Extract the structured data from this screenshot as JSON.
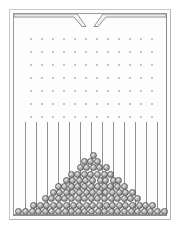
{
  "figure": {
    "subtitle": "bean machine / quincunx",
    "background_color": "#ffffff",
    "frame_outer_color": "#c9c9c9",
    "frame_inner_color": "#8c8c8c",
    "pin_color": "#b9b9bf",
    "divider_color": "#8f8f96",
    "ball_fill_color": "#bdbdbd",
    "ball_outline_color": "#5d5d5d"
  },
  "geometry": {
    "canvas_width": 181,
    "canvas_height": 230,
    "frame_outer": {
      "x": 9,
      "y": 9,
      "width": 162,
      "height": 211
    },
    "frame_inner": {
      "x": 13,
      "y": 13,
      "width": 154,
      "height": 203
    },
    "funnel": {
      "gap_center_x": 90,
      "gap_width": 8,
      "mouth_y": 14,
      "throat_y": 27
    },
    "pin_grid": {
      "rows": 7,
      "columns": 12,
      "first_pin_x": 30,
      "first_pin_y": 38,
      "spacing_x": 11,
      "spacing_y": 13,
      "pin_diameter": 1.6
    },
    "dividers": {
      "count": 13,
      "top_y": 122,
      "bottom_y": 214,
      "first_x": 25,
      "spacing_x": 11
    },
    "ball": {
      "diameter": 7,
      "row_pitch": 6.2,
      "column_pitch": 6.4
    },
    "floor_y": 214
  },
  "chart_data": {
    "type": "bar",
    "subtitle": "Number of balls collected per bin",
    "xlabel": "Bin",
    "ylabel": "Ball count (stack height)",
    "categories": [
      "1",
      "2",
      "3",
      "4",
      "5",
      "6",
      "7",
      "8",
      "9",
      "10",
      "11",
      "12",
      "13",
      "14",
      "15",
      "16",
      "17",
      "18",
      "19",
      "20",
      "21",
      "22",
      "23"
    ],
    "values": [
      1,
      1,
      2,
      2,
      3,
      4,
      5,
      6,
      7,
      8,
      9,
      10,
      9,
      8,
      7,
      6,
      5,
      4,
      3,
      2,
      2,
      1,
      1
    ],
    "ylim": [
      0,
      10
    ],
    "grid": false,
    "legend": false,
    "annotation": "Bell-shaped (approximately normal) profile peaking at the centre bin"
  }
}
